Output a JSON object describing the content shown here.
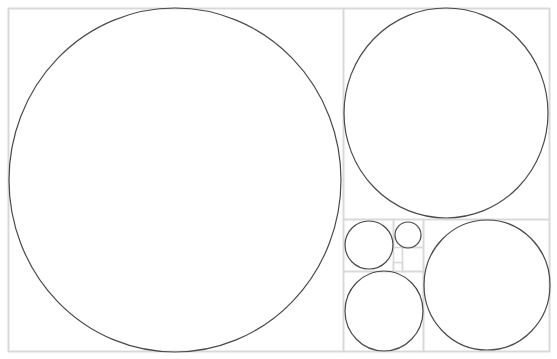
{
  "diagram": {
    "grid_color": "#d9d9d9",
    "circle_color": "#4a4a4a",
    "rects": [
      {
        "id": "outer",
        "x": 8,
        "y": 8,
        "w": 541,
        "h": 343
      },
      {
        "id": "square-a",
        "x": 8,
        "y": 8,
        "w": 335,
        "h": 343
      },
      {
        "id": "square-b",
        "x": 343,
        "y": 8,
        "w": 206,
        "h": 211
      },
      {
        "id": "square-c",
        "x": 423,
        "y": 219,
        "w": 126,
        "h": 132
      },
      {
        "id": "square-d",
        "x": 343,
        "y": 271,
        "w": 80,
        "h": 80
      },
      {
        "id": "square-e",
        "x": 343,
        "y": 219,
        "w": 50,
        "h": 52
      },
      {
        "id": "square-f",
        "x": 393,
        "y": 219,
        "w": 30,
        "h": 28
      },
      {
        "id": "square-g",
        "x": 402,
        "y": 247,
        "w": 21,
        "h": 24
      },
      {
        "id": "square-h",
        "x": 393,
        "y": 262,
        "w": 9,
        "h": 9
      }
    ],
    "circles": [
      {
        "id": "circle-a",
        "cx": 175,
        "cy": 180,
        "rx": 166,
        "ry": 172
      },
      {
        "id": "circle-b",
        "cx": 446,
        "cy": 113,
        "rx": 102,
        "ry": 105
      },
      {
        "id": "circle-c",
        "cx": 487,
        "cy": 285,
        "rx": 63,
        "ry": 65
      },
      {
        "id": "circle-d",
        "cx": 384,
        "cy": 311,
        "rx": 39,
        "ry": 40
      },
      {
        "id": "circle-e",
        "cx": 369,
        "cy": 245,
        "rx": 24,
        "ry": 24
      },
      {
        "id": "circle-f",
        "cx": 408,
        "cy": 235,
        "rx": 13,
        "ry": 13
      }
    ]
  }
}
